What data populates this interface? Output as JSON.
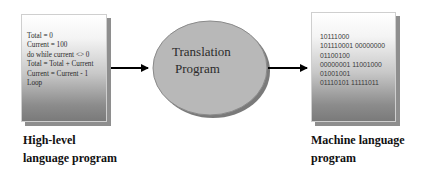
{
  "diagram": {
    "source": {
      "code_lines": [
        "Total = 0",
        "Current = 100",
        "do while current <> 0",
        "Total = Total + Current",
        "Current = Current - 1",
        "Loop"
      ],
      "caption_line1": "High-level",
      "caption_line2": "language program"
    },
    "translator": {
      "label_line1": "Translation",
      "label_line2": "Program",
      "fill_color": "#b8b8b8"
    },
    "target": {
      "code_lines": [
        "10111000",
        "101110001 00000000",
        "01100100",
        "00000001 11001000",
        "01001001",
        "01110101 11111011"
      ],
      "caption_line1": "Machine language",
      "caption_line2": "program"
    },
    "arrow_color": "#000000"
  }
}
